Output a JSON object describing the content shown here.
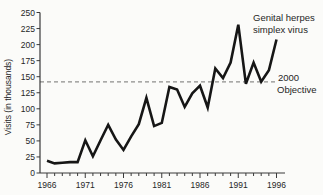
{
  "chart_data": {
    "type": "line",
    "title": "",
    "ylabel": "Visits (in thousands)",
    "xlabel": "",
    "x": [
      1966,
      1967,
      1968,
      1969,
      1970,
      1971,
      1972,
      1973,
      1974,
      1975,
      1976,
      1977,
      1978,
      1979,
      1980,
      1981,
      1982,
      1983,
      1984,
      1985,
      1986,
      1987,
      1988,
      1989,
      1990,
      1991,
      1992,
      1993,
      1994,
      1995,
      1996
    ],
    "values": [
      19,
      15,
      16,
      17,
      17,
      51,
      26,
      51,
      75,
      52,
      36,
      57,
      76,
      117,
      73,
      78,
      134,
      130,
      103,
      124,
      136,
      102,
      163,
      148,
      172,
      231,
      139,
      172,
      142,
      160,
      208
    ],
    "series_label_line1": "Genital herpes",
    "series_label_line2": "simplex virus",
    "objective": {
      "value": 142,
      "label_line1": "2000",
      "label_line2": "Objective"
    },
    "ylim": [
      0,
      250
    ],
    "y_tick_interval": 25,
    "y_tick_labels": [
      "0",
      "25",
      "50",
      "75",
      "100",
      "125",
      "150",
      "175",
      "200",
      "225",
      "250"
    ],
    "x_major_ticks": [
      1966,
      1971,
      1976,
      1981,
      1986,
      1991,
      1996
    ],
    "x_major_tick_labels": [
      "1966",
      "1971",
      "1976",
      "1981",
      "1986",
      "1991",
      "1996"
    ],
    "grid": "off",
    "legend_position": "annotation-top-right",
    "colors": {
      "line": "#161616",
      "objective_line": "#8e8e8c",
      "axis": "#3a3a3a",
      "text": "#262626",
      "background": "#fbfbf9"
    }
  }
}
